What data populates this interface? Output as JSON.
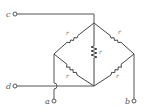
{
  "diagram": {
    "type": "resistor-network",
    "colors": {
      "line": "#555555",
      "background": "#ffffff"
    },
    "terminals": {
      "c": {
        "label": "c",
        "connects_to": "top-node"
      },
      "d": {
        "label": "d",
        "connects_to": "bottom-node"
      },
      "a": {
        "label": "a",
        "connects_to": "left-node"
      },
      "b": {
        "label": "b",
        "connects_to": "right-node"
      }
    },
    "resistors": [
      {
        "id": "r-top-left",
        "label": "r",
        "between": [
          "top-node",
          "left-node"
        ]
      },
      {
        "id": "r-top-right",
        "label": "r",
        "between": [
          "top-node",
          "right-node"
        ]
      },
      {
        "id": "r-center",
        "label": "r",
        "between": [
          "top-node",
          "bottom-node"
        ]
      },
      {
        "id": "r-bottom-left",
        "label": "r",
        "between": [
          "left-node",
          "bottom-node"
        ]
      },
      {
        "id": "r-bottom-right",
        "label": "r",
        "between": [
          "right-node",
          "bottom-node"
        ]
      }
    ]
  }
}
